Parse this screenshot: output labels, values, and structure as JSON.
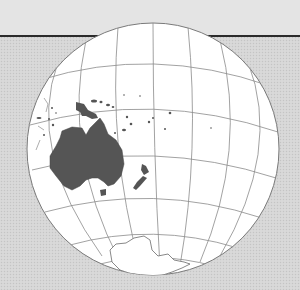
{
  "map": {
    "projection": "orthographic",
    "center_region": "South Pacific / Oceania",
    "labels": [],
    "features": [
      {
        "name": "Australia",
        "fill": "#555555"
      },
      {
        "name": "New Zealand",
        "fill": "#555555"
      },
      {
        "name": "Antarctica",
        "fill": "#ffffff"
      },
      {
        "name": "New Guinea",
        "fill": "#555555"
      },
      {
        "name": "Pacific islands",
        "fill": "#555555"
      }
    ],
    "colors": {
      "ocean": "#ffffff",
      "land": "#555555",
      "graticule": "#8a8a8a",
      "background": "#d6d6d6",
      "horizon_line": "#2b2b2b"
    }
  }
}
